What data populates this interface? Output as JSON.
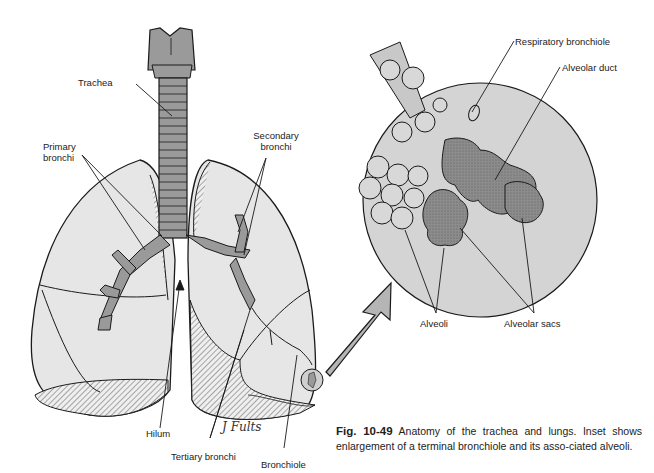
{
  "figure": {
    "labels": {
      "trachea": "Trachea",
      "primary_bronchi": "Primary\nbronchi",
      "primary_bronchi_l1": "Primary",
      "primary_bronchi_l2": "bronchi",
      "secondary_bronchi_l1": "Secondary",
      "secondary_bronchi_l2": "bronchi",
      "hilum": "Hilum",
      "tertiary_bronchi": "Tertiary bronchi",
      "bronchiole": "Bronchiole",
      "respiratory_bronchiole": "Respiratory bronchiole",
      "alveolar_duct": "Alveolar duct",
      "alveoli": "Alveoli",
      "alveolar_sacs": "Alveolar sacs"
    },
    "signature": "J Fults",
    "caption": {
      "fig_number": "Fig. 10-49",
      "text": " Anatomy of the trachea and lungs. Inset shows enlargement of a terminal bronchiole and its asso-ciated alveoli."
    },
    "colors": {
      "lung_fill": "#e6e6e6",
      "airway_fill": "#9a9a9a",
      "inset_fill": "#d4d4d4",
      "sac_fill": "#8c8c8c",
      "outline": "#1a1a1a"
    }
  }
}
